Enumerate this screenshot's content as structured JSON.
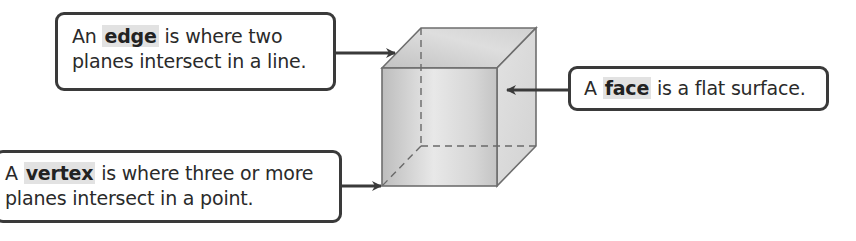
{
  "diagram": {
    "type": "labeled-figure",
    "callouts": [
      {
        "id": "edge",
        "prefix": "An ",
        "term": "edge",
        "suffix": " is where two",
        "line2": "planes intersect in a line.",
        "target": "cube-edge"
      },
      {
        "id": "face",
        "prefix": "A ",
        "term": "face",
        "suffix": " is a flat surface.",
        "line2": "",
        "target": "cube-face"
      },
      {
        "id": "vertex",
        "prefix": "A ",
        "term": "vertex",
        "suffix": " is where three or more",
        "line2": "planes intersect in a point.",
        "target": "cube-vertex"
      }
    ],
    "colors": {
      "outline": "#3a3a3a",
      "term_highlight": "#e2e2e2",
      "cube_edge": "#6e6e6e",
      "cube_face_light": "#e6e6e6",
      "cube_face_dark": "#b9b9b9"
    }
  }
}
